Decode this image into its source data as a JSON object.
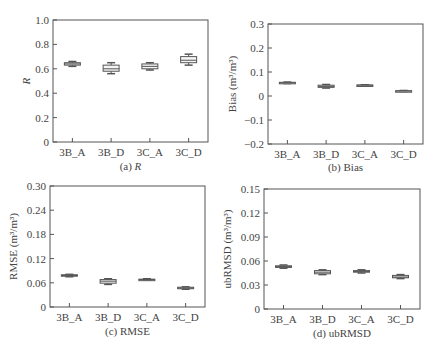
{
  "chart_data": [
    {
      "type": "box",
      "title": "(a) R",
      "caption_prefix": "(a) ",
      "caption_var": "R",
      "xlabel": "",
      "ylabel": "R",
      "ylim": [
        0,
        1.0
      ],
      "yticks": [
        0,
        0.2,
        0.4,
        0.6,
        0.8,
        1.0
      ],
      "ytick_labels": [
        "0",
        "0.2",
        "0.4",
        "0.6",
        "0.8",
        "1.0"
      ],
      "categories": [
        "3B_A",
        "3B_D",
        "3C_A",
        "3C_D"
      ],
      "boxes": [
        {
          "min": 0.62,
          "q1": 0.63,
          "median": 0.64,
          "q3": 0.65,
          "max": 0.66
        },
        {
          "min": 0.56,
          "q1": 0.58,
          "median": 0.6,
          "q3": 0.63,
          "max": 0.65
        },
        {
          "min": 0.59,
          "q1": 0.6,
          "median": 0.62,
          "q3": 0.64,
          "max": 0.65
        },
        {
          "min": 0.63,
          "q1": 0.65,
          "median": 0.67,
          "q3": 0.7,
          "max": 0.72
        }
      ],
      "grid": false
    },
    {
      "type": "box",
      "title": "(b) Bias",
      "caption_prefix": "(b) ",
      "caption_var": "Bias",
      "xlabel": "",
      "ylabel": "Bias (m³/m³)",
      "ylim": [
        -0.2,
        0.3
      ],
      "yticks": [
        -0.2,
        -0.1,
        0,
        0.1,
        0.2,
        0.3
      ],
      "ytick_labels": [
        "−0.2",
        "−0.1",
        "0",
        "0.1",
        "0.2",
        "0.3"
      ],
      "categories": [
        "3B_A",
        "3B_D",
        "3C_A",
        "3C_D"
      ],
      "boxes": [
        {
          "min": 0.052,
          "q1": 0.054,
          "median": 0.055,
          "q3": 0.057,
          "max": 0.058
        },
        {
          "min": 0.033,
          "q1": 0.036,
          "median": 0.04,
          "q3": 0.045,
          "max": 0.048
        },
        {
          "min": 0.044,
          "q1": 0.045,
          "median": 0.045,
          "q3": 0.046,
          "max": 0.047
        },
        {
          "min": 0.019,
          "q1": 0.02,
          "median": 0.021,
          "q3": 0.022,
          "max": 0.023
        }
      ],
      "grid": false
    },
    {
      "type": "box",
      "title": "(c) RMSE",
      "caption_prefix": "(c) ",
      "caption_var": "RMSE",
      "xlabel": "",
      "ylabel": "RMSE (m³/m³)",
      "ylim": [
        0,
        0.3
      ],
      "yticks": [
        0,
        0.06,
        0.12,
        0.18,
        0.24,
        0.3
      ],
      "ytick_labels": [
        "0",
        "0.06",
        "0.12",
        "0.18",
        "0.24",
        "0.30"
      ],
      "categories": [
        "3B_A",
        "3B_D",
        "3C_A",
        "3C_D"
      ],
      "boxes": [
        {
          "min": 0.075,
          "q1": 0.077,
          "median": 0.078,
          "q3": 0.08,
          "max": 0.081
        },
        {
          "min": 0.056,
          "q1": 0.059,
          "median": 0.064,
          "q3": 0.068,
          "max": 0.07
        },
        {
          "min": 0.067,
          "q1": 0.068,
          "median": 0.068,
          "q3": 0.069,
          "max": 0.07
        },
        {
          "min": 0.044,
          "q1": 0.046,
          "median": 0.047,
          "q3": 0.049,
          "max": 0.05
        }
      ],
      "grid": false
    },
    {
      "type": "box",
      "title": "(d) ubRMSD",
      "caption_prefix": "(d) ",
      "caption_var": "ubRMSD",
      "xlabel": "",
      "ylabel": "ubRMSD (m³/m³)",
      "ylim": [
        0,
        0.15
      ],
      "yticks": [
        0,
        0.03,
        0.06,
        0.09,
        0.12,
        0.15
      ],
      "ytick_labels": [
        "0",
        "0.03",
        "0.06",
        "0.09",
        "0.12",
        "0.15"
      ],
      "categories": [
        "3B_A",
        "3B_D",
        "3C_A",
        "3C_D"
      ],
      "boxes": [
        {
          "min": 0.051,
          "q1": 0.052,
          "median": 0.053,
          "q3": 0.054,
          "max": 0.055
        },
        {
          "min": 0.043,
          "q1": 0.044,
          "median": 0.046,
          "q3": 0.048,
          "max": 0.049
        },
        {
          "min": 0.045,
          "q1": 0.046,
          "median": 0.047,
          "q3": 0.048,
          "max": 0.049
        },
        {
          "min": 0.038,
          "q1": 0.039,
          "median": 0.04,
          "q3": 0.042,
          "max": 0.043
        }
      ],
      "grid": false
    }
  ],
  "layout": {
    "panels": [
      {
        "left": 53,
        "right": 208,
        "top": 20,
        "bottom": 142,
        "ylabel_x": 30,
        "caption_y": 170
      },
      {
        "left": 268,
        "right": 423,
        "top": 24,
        "bottom": 144,
        "ylabel_x": 236,
        "caption_y": 171
      },
      {
        "left": 50,
        "right": 205,
        "top": 186,
        "bottom": 307,
        "ylabel_x": 17,
        "caption_y": 335
      },
      {
        "left": 264,
        "right": 420,
        "top": 189,
        "bottom": 309,
        "ylabel_x": 231,
        "caption_y": 337
      }
    ],
    "colors": {
      "axis": "#555555",
      "box_stroke": "#555555",
      "box_fill": "#f4f4f4",
      "text": "#444444"
    }
  }
}
